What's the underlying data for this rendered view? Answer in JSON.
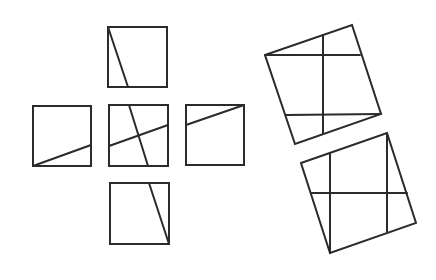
{
  "diagram": {
    "stroke_color": "#2b2b2b",
    "background": "#ffffff",
    "cross_arrangement": {
      "top": {
        "rect": [
          108,
          27,
          59,
          60
        ],
        "lines": [
          [
            108,
            27,
            128,
            87
          ]
        ]
      },
      "left": {
        "rect": [
          33,
          106,
          58,
          60
        ],
        "lines": [
          [
            33,
            166,
            91,
            145
          ]
        ]
      },
      "center": {
        "rect": [
          109,
          105,
          59,
          61
        ],
        "lines": [
          [
            129,
            105,
            148,
            166
          ],
          [
            109,
            146,
            168,
            125
          ]
        ]
      },
      "right": {
        "rect": [
          186,
          105,
          58,
          60
        ],
        "lines": [
          [
            186,
            125,
            244,
            105
          ]
        ]
      },
      "bottom": {
        "rect": [
          110,
          183,
          59,
          61
        ],
        "lines": [
          [
            149,
            183,
            169,
            244
          ]
        ]
      }
    },
    "rotated_squares": [
      {
        "polygon": "265,55 352,25 381,114 295,144",
        "lines": [
          [
            265,
            55,
            360,
            55
          ],
          [
            286,
            115,
            381,
            114
          ],
          [
            323,
            35,
            323,
            134
          ]
        ]
      },
      {
        "polygon": "301,163 387,133 416,223 330,253",
        "lines": [
          [
            311,
            193,
            407,
            193
          ],
          [
            330,
            154,
            330,
            253
          ],
          [
            387,
            133,
            387,
            232
          ]
        ]
      }
    ]
  }
}
